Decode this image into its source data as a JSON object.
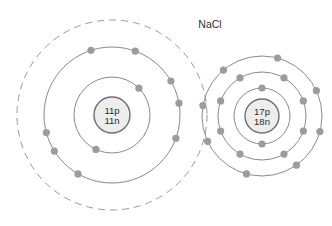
{
  "diagram": {
    "title": "NaCl",
    "title_position": {
      "x": 210,
      "y": 28
    },
    "background_color": "#ffffff",
    "ring_color": "#8a8a8a",
    "dashed_ring_color": "#9a9a9a",
    "electron_color": "#9c9c9c",
    "nucleus_fill": "#ededed",
    "nucleus_stroke": "#6f6f6f",
    "atoms": [
      {
        "id": "sodium",
        "name": "sodium-atom",
        "element_symbol": "Na",
        "center": {
          "x": 112,
          "y": 115
        },
        "nucleus": {
          "radius": 18,
          "protons_label": "11p",
          "neutrons_label": "11n",
          "protons": 11,
          "neutrons": 11
        },
        "shells": [
          {
            "index": 1,
            "radius": 38,
            "style": "solid",
            "electron_count": 2,
            "electron_angles": [
              -45,
              115
            ]
          },
          {
            "index": 2,
            "radius": 68,
            "style": "solid",
            "electron_count": 8,
            "electron_angles": [
              -108,
              -70,
              -30,
              -10,
              20,
              165,
              148,
              120
            ]
          },
          {
            "index": 3,
            "radius": 95,
            "style": "dashed",
            "electron_count": 0,
            "electron_angles": []
          }
        ]
      },
      {
        "id": "chlorine",
        "name": "chlorine-atom",
        "element_symbol": "Cl",
        "center": {
          "x": 262,
          "y": 116
        },
        "nucleus": {
          "radius": 17,
          "protons_label": "17p",
          "neutrons_label": "18n",
          "protons": 17,
          "neutrons": 18
        },
        "shells": [
          {
            "index": 1,
            "radius": 28,
            "style": "solid",
            "electron_count": 2,
            "electron_angles": [
              -90,
              90
            ]
          },
          {
            "index": 2,
            "radius": 44,
            "style": "solid",
            "electron_count": 8,
            "electron_angles": [
              -120,
              -60,
              -20,
              20,
              60,
              120,
              160,
              200
            ]
          },
          {
            "index": 3,
            "radius": 60,
            "style": "solid",
            "electron_count": 8,
            "electron_angles": [
              -130,
              -75,
              -25,
              15,
              55,
              105,
              155,
              190
            ]
          }
        ]
      }
    ],
    "electron_radius": 3.6
  }
}
